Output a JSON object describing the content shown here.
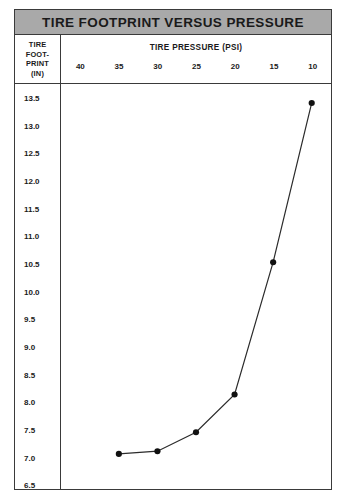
{
  "figure": {
    "title": "TIRE FOOTPRINT VERSUS PRESSURE",
    "y_header_lines": [
      "TIRE",
      "FOOT-",
      "PRINT",
      "(IN)"
    ],
    "x_header": "TIRE PRESSURE (PSI)"
  },
  "chart_data": {
    "type": "line",
    "title": "TIRE FOOTPRINT VERSUS PRESSURE",
    "xlabel": "TIRE PRESSURE (PSI)",
    "ylabel": "TIRE FOOTPRINT (IN)",
    "x": [
      35,
      30,
      25,
      20,
      15,
      10
    ],
    "values": [
      6.9,
      6.95,
      7.3,
      8.0,
      10.45,
      13.4
    ],
    "xtick_labels": [
      "40",
      "35",
      "30",
      "25",
      "20",
      "15",
      "10"
    ],
    "xticks": [
      40,
      35,
      30,
      25,
      20,
      15,
      10
    ],
    "xlim": [
      42.5,
      7.5
    ],
    "x_axis_direction": "descending",
    "ytick_labels": [
      "13.5",
      "13.0",
      "12.5",
      "12.0",
      "11.5",
      "11.0",
      "10.5",
      "10.0",
      "9.5",
      "9.0",
      "8.5",
      "8.0",
      "7.5",
      "7.0",
      "6.5"
    ],
    "yticks": [
      13.5,
      13.0,
      12.5,
      12.0,
      11.5,
      11.0,
      10.5,
      10.0,
      9.5,
      9.0,
      8.5,
      8.0,
      7.5,
      7.0,
      6.5
    ],
    "ylim": [
      6.25,
      13.75
    ],
    "grid": false,
    "legend": null,
    "marker": "filled-circle",
    "line_color": "#2b2b2b",
    "marker_color": "#111111",
    "banner_color": "#a9a9a9",
    "border_color": "#3a3a3a"
  }
}
